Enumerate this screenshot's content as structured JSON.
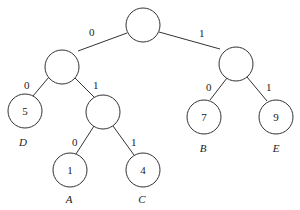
{
  "diagram": {
    "type": "binary-tree",
    "nodes": {
      "root": {
        "value": ""
      },
      "l": {
        "value": ""
      },
      "r": {
        "value": ""
      },
      "ll": {
        "value": "5",
        "name": "D"
      },
      "lr": {
        "value": ""
      },
      "lrl": {
        "value": "1",
        "name": "A"
      },
      "lrr": {
        "value": "4",
        "name": "C"
      },
      "rl": {
        "value": "7",
        "name": "B"
      },
      "rr": {
        "value": "9",
        "name": "E"
      }
    },
    "edges": {
      "root_l": "0",
      "root_r": "1",
      "l_ll": "0",
      "l_lr": "1",
      "lr_lrl": "0",
      "lr_lrr": "1",
      "r_rl": "0",
      "r_rr": "1"
    }
  }
}
